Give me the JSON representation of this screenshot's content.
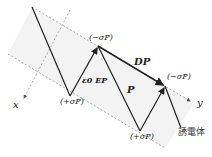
{
  "diagram": {
    "labels": {
      "x_axis": "x",
      "y_axis": "y",
      "top_left_charge": "(−σP)",
      "top_right_charge": "(−σP)",
      "bottom_left_charge": "(+σP)",
      "bottom_right_charge": "(+σP)",
      "field_eps": "ε0 EP",
      "polarization": "P",
      "displacement": "DP",
      "dielectric": "誘電体"
    },
    "colors": {
      "line": "#222222",
      "dashed": "#999999",
      "shade": "#f0f0f0"
    }
  }
}
